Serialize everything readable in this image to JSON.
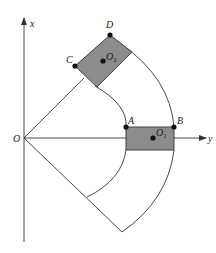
{
  "figure": {
    "axes": {
      "x_label": "x",
      "y_label": "y",
      "origin_label": "O"
    },
    "points": {
      "A": "A",
      "B": "B",
      "C": "C",
      "D": "D"
    },
    "centers": {
      "o1": {
        "main": "O",
        "sub": "1"
      },
      "o2": {
        "main": "O",
        "sub": "2"
      }
    },
    "colors": {
      "line": "#333333",
      "block_fill": "#8c8c8c",
      "dot": "#111111",
      "background": "#ffffff"
    }
  }
}
